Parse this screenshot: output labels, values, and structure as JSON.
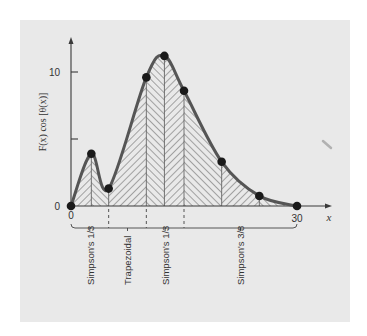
{
  "chart_data": {
    "type": "area",
    "title": "",
    "xlabel": "x",
    "ylabel": "F(x) cos [θ(x)]",
    "xlim": [
      0,
      30
    ],
    "ylim": [
      0,
      12.5
    ],
    "x_ticks": [
      {
        "value": 0,
        "label": "0"
      },
      {
        "value": 30,
        "label": "30"
      }
    ],
    "y_ticks": [
      {
        "value": 0,
        "label": "0"
      },
      {
        "value": 5,
        "label": ""
      },
      {
        "value": 10,
        "label": "10"
      }
    ],
    "grid": false,
    "series": [
      {
        "name": "F(x) cos [θ(x)] sample points",
        "x": [
          0,
          2.7,
          5,
          10,
          12.4,
          15,
          20,
          25,
          30
        ],
        "y": [
          0,
          3.9,
          1.3,
          9.6,
          11.2,
          8.6,
          3.3,
          0.75,
          0
        ]
      }
    ],
    "integration_segments": [
      {
        "label": "Simpson's 1/3",
        "x_start": 0,
        "x_end": 5
      },
      {
        "label": "Trapezoidal",
        "x_start": 5,
        "x_end": 10
      },
      {
        "label": "Simpson's 1/3",
        "x_start": 10,
        "x_end": 15
      },
      {
        "label": "Simpson's 3/8",
        "x_start": 15,
        "x_end": 30
      }
    ]
  },
  "colors": {
    "panel": "#e9e9e9",
    "curve": "#555555",
    "points": "#1a1a1a",
    "hatch": "#5a5a5a"
  }
}
